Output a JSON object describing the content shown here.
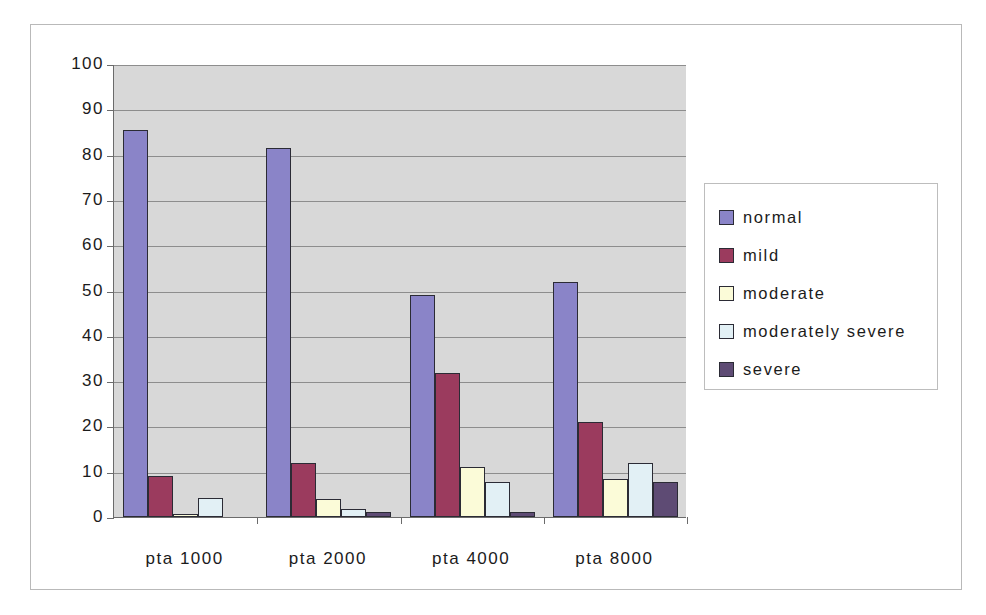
{
  "chart_data": {
    "type": "bar",
    "title": "",
    "xlabel": "",
    "ylabel": "",
    "ylim": [
      0,
      100
    ],
    "ytick_step": 10,
    "grid": true,
    "legend_position": "right",
    "categories": [
      "pta 1000",
      "pta 2000",
      "pta 4000",
      "pta 8000"
    ],
    "ytick_labels": [
      "100",
      "90",
      "80",
      "70",
      "60",
      "50",
      "40",
      "30",
      "20",
      "10",
      "0"
    ],
    "series": [
      {
        "name": "normal",
        "color": "#8A84C8",
        "values": [
          85.5,
          81.5,
          49.0,
          51.8
        ]
      },
      {
        "name": "mild",
        "color": "#9B3B5E",
        "values": [
          9.0,
          12.0,
          31.7,
          21.0
        ]
      },
      {
        "name": "moderate",
        "color": "#FBFBD8",
        "values": [
          0.7,
          4.0,
          11.0,
          8.5
        ]
      },
      {
        "name": "moderately severe",
        "color": "#E2F0F5",
        "values": [
          4.3,
          1.7,
          7.7,
          12.0
        ]
      },
      {
        "name": "severe",
        "color": "#5E4B74",
        "values": [
          0.0,
          1.0,
          1.0,
          7.7
        ]
      }
    ],
    "plot_background": "#D8D8D8",
    "gridline_color": "#8D8D8D",
    "axis_color": "#6B6B6B"
  }
}
